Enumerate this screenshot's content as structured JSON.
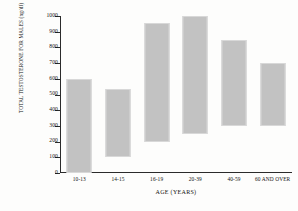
{
  "chart_data": {
    "type": "bar",
    "bar_style": "floating-range",
    "title": "",
    "xlabel": "AGE (YEARS)",
    "ylabel": "TOTAL TESTOSTERONE FOR MALES (ng/dl)",
    "categories": [
      "10-13",
      "14-15",
      "16-19",
      "20-39",
      "40-59",
      "60 AND OVER"
    ],
    "series": [
      {
        "name": "Total testosterone range",
        "low": [
          0,
          100,
          195,
          250,
          300,
          300
        ],
        "high": [
          600,
          535,
          955,
          1000,
          850,
          700
        ]
      }
    ],
    "ylim": [
      0,
      1000
    ],
    "yticks": [
      0,
      100,
      200,
      300,
      400,
      500,
      600,
      700,
      800,
      900,
      1000
    ],
    "ytick_labels": [
      "0",
      "100",
      "200",
      "300",
      "400",
      "500",
      "600",
      "700",
      "800",
      "900",
      "1000"
    ],
    "grid": false,
    "legend": "none",
    "bar_color": "#c2c2c2",
    "axis_color": "#2b2b2b"
  }
}
